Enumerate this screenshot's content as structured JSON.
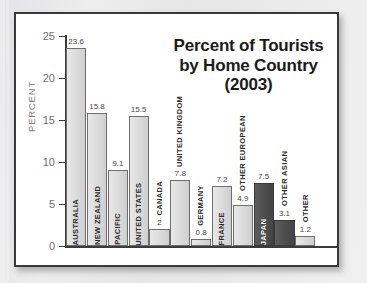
{
  "chart_data": {
    "type": "bar",
    "title": "Percent of Tourists by Home Country (2003)",
    "title_lines": [
      "Percent of Tourists",
      "by Home Country",
      "(2003)"
    ],
    "xlabel": "",
    "ylabel": "PERCENT",
    "ylim": [
      0,
      25
    ],
    "yticks": [
      0,
      5,
      10,
      15,
      20,
      25
    ],
    "ytick_labels": [
      "0",
      "5",
      "10",
      "15",
      "20",
      "25"
    ],
    "grid": false,
    "legend": "none",
    "categories": [
      "Australia",
      "New Zealand",
      "Pacific",
      "United States",
      "Canada",
      "United Kingdom",
      "Germany",
      "France",
      "Other European",
      "Japan",
      "Other Asian",
      "Other"
    ],
    "values": [
      23.6,
      15.8,
      9.1,
      15.5,
      2,
      7.8,
      0.8,
      7.2,
      4.9,
      7.5,
      3.1,
      1.2
    ],
    "value_labels": [
      "23.6",
      "15.8",
      "9.1",
      "15.5",
      "2",
      "7.8",
      "0.8",
      "7.2",
      "4.9",
      "7.5",
      "3.1",
      "1.2"
    ],
    "bar_styles": [
      "light",
      "light",
      "light",
      "light",
      "light",
      "light",
      "light",
      "light",
      "light",
      "dark",
      "dark",
      "light"
    ],
    "colors": {
      "bar_light": "#dcdcdc",
      "bar_dark": "#4e4e4e",
      "bar_border": "#6a6a6a",
      "axis": "#3c3c3c",
      "tick_text": "#6e6e6e",
      "title_text": "#1b1b1b",
      "plate": "#ffffff",
      "frame": "#3a3a3a",
      "page_background": "#e9e9ea"
    }
  }
}
